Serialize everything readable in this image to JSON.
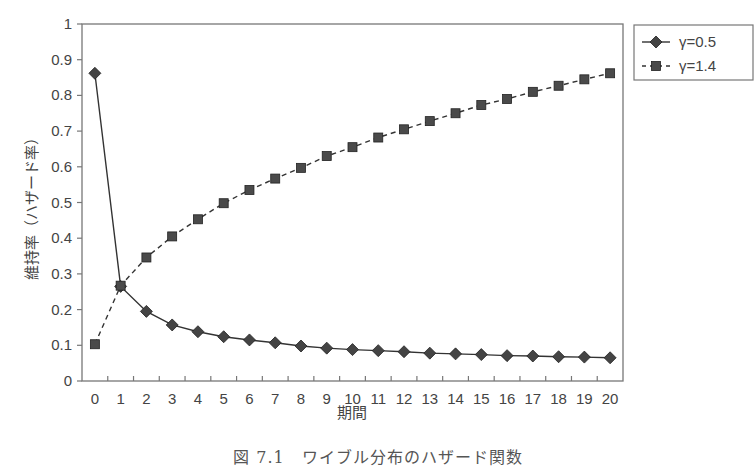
{
  "chart_data": {
    "type": "line",
    "title": "",
    "caption": "図 7.1　ワイブル分布のハザード関数",
    "xlabel": "期間",
    "ylabel": "維持率（ハザード率）",
    "x": [
      0,
      1,
      2,
      3,
      4,
      5,
      6,
      7,
      8,
      9,
      10,
      11,
      12,
      13,
      14,
      15,
      16,
      17,
      18,
      19,
      20
    ],
    "ylim": [
      0,
      1
    ],
    "yticks": [
      "0",
      "0.1",
      "0.2",
      "0.3",
      "0.4",
      "0.5",
      "0.6",
      "0.7",
      "0.8",
      "0.9",
      "1"
    ],
    "grid": false,
    "legend_position": "right-top",
    "series": [
      {
        "name": "γ=0.5",
        "marker": "diamond",
        "line": "solid",
        "color": "#333333",
        "values": [
          0.862,
          0.265,
          0.195,
          0.157,
          0.138,
          0.124,
          0.115,
          0.107,
          0.098,
          0.092,
          0.088,
          0.085,
          0.082,
          0.078,
          0.076,
          0.074,
          0.071,
          0.07,
          0.068,
          0.067,
          0.065
        ]
      },
      {
        "name": "γ=1.4",
        "marker": "square",
        "line": "dashed",
        "color": "#333333",
        "values": [
          0.103,
          0.267,
          0.346,
          0.405,
          0.453,
          0.498,
          0.535,
          0.567,
          0.597,
          0.63,
          0.655,
          0.682,
          0.705,
          0.728,
          0.75,
          0.773,
          0.79,
          0.81,
          0.827,
          0.845,
          0.862
        ]
      }
    ]
  },
  "legend": {
    "items": [
      {
        "label": "γ=0.5"
      },
      {
        "label": "γ=1.4"
      }
    ]
  }
}
